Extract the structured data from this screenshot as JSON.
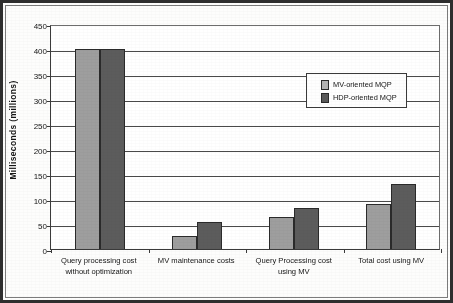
{
  "chart_data": {
    "type": "bar",
    "title": "",
    "subtitle": "",
    "xlabel": "",
    "ylabel": "Milliseconds (millions)",
    "ylim": [
      0,
      450
    ],
    "ytick_step": 50,
    "yticks": [
      0,
      50,
      100,
      150,
      200,
      250,
      300,
      350,
      400,
      450
    ],
    "grid": true,
    "legend_position": "upper right",
    "categories": [
      "Query processing cost without optimization",
      "MV maintenance costs",
      "Query Processing cost using MV",
      "Total cost using MV"
    ],
    "series": [
      {
        "name": "MV-oriented MQP",
        "color": "#9e9e9e",
        "values": [
          400,
          27,
          65,
          90
        ],
        "clipped": [
          true,
          false,
          false,
          false
        ]
      },
      {
        "name": "HDP-oriented MQP",
        "color": "#5c5c5c",
        "values": [
          400,
          55,
          82,
          130
        ],
        "clipped": [
          true,
          false,
          false,
          false
        ]
      }
    ]
  },
  "legend": {
    "entries": [
      {
        "label": "MV-oriented MQP",
        "swatch": "light-gray"
      },
      {
        "label": "HDP-oriented MQP",
        "swatch": "dark-gray"
      }
    ]
  },
  "axis": {
    "y_title": "Milliseconds (millions)"
  }
}
